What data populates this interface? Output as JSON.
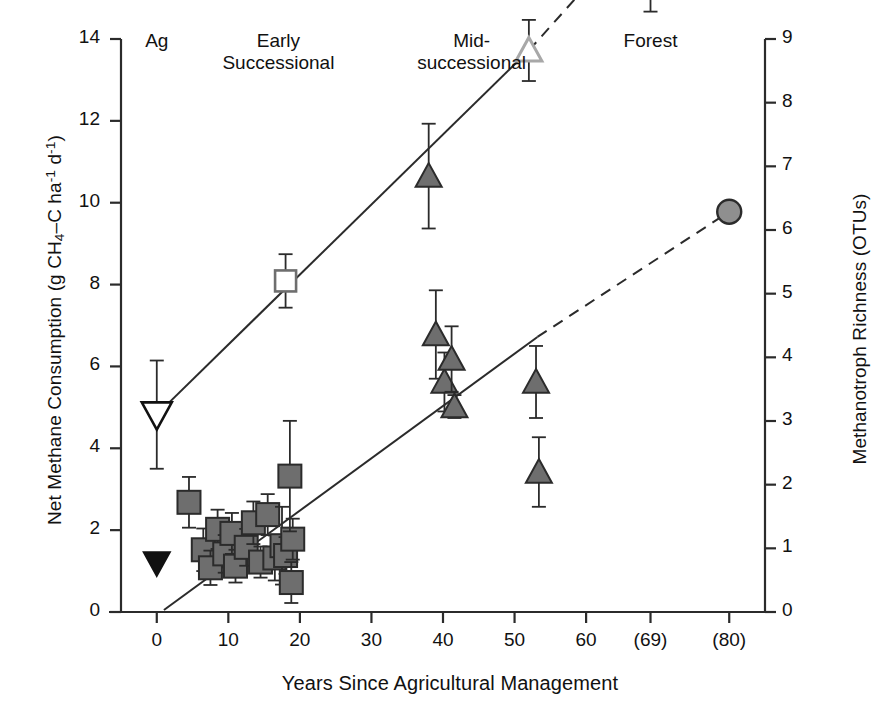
{
  "chart_data": {
    "type": "scatter",
    "title": "",
    "xlabel": "Years Since Agricultural Management",
    "ylabel_left": "Net Methane Consumption (g CH4–C ha⁻¹ d⁻¹)",
    "ylabel_right": "Methanotroph Richness (OTUs)",
    "xlim": [
      -5,
      85
    ],
    "ylim_left": [
      0,
      14
    ],
    "ylim_right": [
      0,
      9
    ],
    "xticks": [
      0,
      10,
      20,
      30,
      40,
      50,
      60,
      69,
      80
    ],
    "xticklabels": [
      "0",
      "10",
      "20",
      "30",
      "40",
      "50",
      "60",
      "(69)",
      "(80)"
    ],
    "yticks_left": [
      0,
      2,
      4,
      6,
      8,
      10,
      12,
      14
    ],
    "yticklabels_left": [
      "0",
      "2",
      "4",
      "6",
      "8",
      "10",
      "12",
      "14"
    ],
    "yticks_right": [
      0,
      1,
      2,
      3,
      4,
      5,
      6,
      7,
      8,
      9
    ],
    "yticklabels_right": [
      "0",
      "1",
      "2",
      "3",
      "4",
      "5",
      "6",
      "7",
      "8",
      "9"
    ],
    "grid": false,
    "legend": "none",
    "group_labels": [
      {
        "text": "Ag",
        "x": 0
      },
      {
        "text": "Early\nSuccessional",
        "x": 17
      },
      {
        "text": "Mid-\nsuccessional",
        "x": 44
      },
      {
        "text": "Forest",
        "x": 69
      }
    ],
    "series": [
      {
        "name": "Methane consumption – agricultural (filled down triangle)",
        "marker": "triangle-down-filled",
        "color": "#111111",
        "axis": "left",
        "points": [
          {
            "x": 0,
            "y": 1.2,
            "err": 0.0
          }
        ]
      },
      {
        "name": "Methanotroph richness – agricultural (open down triangle)",
        "marker": "triangle-down-open",
        "color": "#ffffff",
        "axis": "right",
        "points": [
          {
            "x": 0,
            "y": 3.1,
            "err": 0.85
          }
        ]
      },
      {
        "name": "Methane consumption – early successional (filled squares)",
        "marker": "square-filled",
        "color": "#6e6e6e",
        "axis": "left",
        "points": [
          {
            "x": 4.5,
            "y": 2.68,
            "err": 0.62
          },
          {
            "x": 6.5,
            "y": 1.52,
            "err": 0.52
          },
          {
            "x": 7.5,
            "y": 1.08,
            "err": 0.42
          },
          {
            "x": 8.5,
            "y": 2.02,
            "err": 0.48
          },
          {
            "x": 9.5,
            "y": 1.42,
            "err": 0.46
          },
          {
            "x": 10.5,
            "y": 1.92,
            "err": 0.5
          },
          {
            "x": 11.0,
            "y": 1.12,
            "err": 0.4
          },
          {
            "x": 12.5,
            "y": 1.58,
            "err": 0.45
          },
          {
            "x": 13.5,
            "y": 2.18,
            "err": 0.52
          },
          {
            "x": 14.5,
            "y": 1.22,
            "err": 0.38
          },
          {
            "x": 15.5,
            "y": 2.38,
            "err": 0.5
          },
          {
            "x": 16.5,
            "y": 1.32,
            "err": 0.55
          },
          {
            "x": 17.5,
            "y": 1.62,
            "err": 0.95
          },
          {
            "x": 18.0,
            "y": 1.38,
            "err": 0.45
          },
          {
            "x": 19.0,
            "y": 1.78,
            "err": 0.5
          },
          {
            "x": 18.6,
            "y": 3.32,
            "err": 1.35
          },
          {
            "x": 18.8,
            "y": 0.72,
            "err": 0.5
          }
        ]
      },
      {
        "name": "Methanotroph richness – early successional (open square)",
        "marker": "square-open",
        "color": "#ffffff",
        "axis": "right",
        "points": [
          {
            "x": 18,
            "y": 5.2,
            "err": 0.42
          }
        ]
      },
      {
        "name": "Methane consumption – mid-successional (gray triangles)",
        "marker": "triangle-up-filled",
        "color": "#6e6e6e",
        "axis": "left",
        "points": [
          {
            "x": 39.0,
            "y": 6.78,
            "err": 1.08
          },
          {
            "x": 40.2,
            "y": 5.62,
            "err": 0.72
          },
          {
            "x": 41.2,
            "y": 6.18,
            "err": 0.8
          },
          {
            "x": 41.6,
            "y": 5.02,
            "err": 0.28
          },
          {
            "x": 53.0,
            "y": 5.62,
            "err": 0.88
          },
          {
            "x": 53.4,
            "y": 3.42,
            "err": 0.85
          }
        ]
      },
      {
        "name": "Methane consumption – mid-successional outlier (dark triangle)",
        "marker": "triangle-up-filled",
        "color": "#6e6e6e",
        "axis": "left",
        "points": [
          {
            "x": 38.0,
            "y": 10.65,
            "err": 1.28
          }
        ]
      },
      {
        "name": "Methanotroph richness – mid-successional (light open triangle)",
        "marker": "triangle-up-open",
        "color": "#b5b5b5",
        "axis": "right",
        "points": [
          {
            "x": 52.0,
            "y": 8.82,
            "err": 0.48
          }
        ]
      },
      {
        "name": "Methanotroph richness – forest (open circle)",
        "marker": "circle-open",
        "color": "#bdbdbd",
        "axis": "right",
        "points": [
          {
            "x": 69,
            "y": 10.95,
            "err": 1.52
          }
        ]
      },
      {
        "name": "Methane consumption – forest (gray filled circle)",
        "marker": "circle-filled",
        "color": "#8f8f8f",
        "axis": "left",
        "points": [
          {
            "x": 80,
            "y": 9.78,
            "err": 0.0
          }
        ]
      }
    ],
    "fit_lines": [
      {
        "name": "richness-regression",
        "style": "solid",
        "x1": 0,
        "y1": 3.1,
        "x2": 52,
        "y2": 8.82
      },
      {
        "name": "richness-extrapolation",
        "style": "dashed",
        "x1": 52,
        "y1": 8.82,
        "x2": 69,
        "y2": 10.95
      },
      {
        "name": "consumption-regression",
        "style": "solid",
        "x1": 1.0,
        "y1": 0.05,
        "x2": 53.2,
        "y2": 6.72
      },
      {
        "name": "consumption-extrapolation",
        "style": "dashed",
        "x1": 53.2,
        "y1": 6.72,
        "x2": 80,
        "y2": 9.78
      }
    ]
  }
}
